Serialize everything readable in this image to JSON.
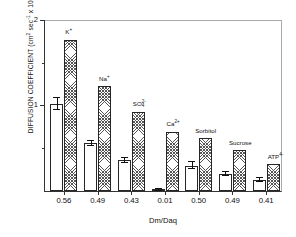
{
  "chart_data": {
    "type": "bar",
    "title": "",
    "xlabel": "Dm/Daq",
    "ylabel": "DIFFUSION COEFFICIENT (cm² sec⁻¹ × 10⁶)",
    "ylabel_parts": {
      "main": "DIFFUSION COEFFICIENT (cm",
      "sup1": "2",
      "mid": " sec",
      "sup2": "-1",
      "tail": " x 10",
      "sup3": "6",
      "close": ")"
    },
    "ylim": [
      0,
      2
    ],
    "y_major_ticks": [
      1,
      2
    ],
    "y_minor_ticks": [
      0.5,
      1.5
    ],
    "y_tick_labels": [
      "1",
      "2"
    ],
    "grid": false,
    "legend": "none",
    "categories": [
      "K+",
      "Na+",
      "SO4 2-",
      "Ca2+",
      "Sorbitol",
      "Sucrose",
      "ATP4-"
    ],
    "category_labels": [
      {
        "text": "K",
        "sup": "+",
        "sub": "",
        "plain": "K⁺"
      },
      {
        "text": "Na",
        "sup": "+",
        "sub": "",
        "plain": "Na⁺"
      },
      {
        "text": "SO",
        "sup": "2-",
        "sub": "4",
        "plain": "SO₄²⁻"
      },
      {
        "text": "Ca",
        "sup": "2+",
        "sub": "",
        "plain": "Ca²⁺"
      },
      {
        "text": "Sorbitol",
        "sup": "",
        "sub": "",
        "plain": "Sorbitol"
      },
      {
        "text": "Sucrose",
        "sup": "",
        "sub": "",
        "plain": "Sucrose"
      },
      {
        "text": "ATP",
        "sup": "4-",
        "sub": "",
        "plain": "ATP⁴⁻"
      }
    ],
    "x_tick_labels": [
      "0.56",
      "0.49",
      "0.43",
      "0.01",
      "0.50",
      "0.49",
      "0.41"
    ],
    "series": [
      {
        "name": "membrane (open)",
        "style": "open",
        "values": [
          1.02,
          0.56,
          0.36,
          0.01,
          0.3,
          0.2,
          0.13
        ],
        "errors": [
          0.07,
          0.03,
          0.03,
          0.01,
          0.04,
          0.02,
          0.02
        ]
      },
      {
        "name": "aqueous (hatched)",
        "style": "hatched",
        "values": [
          1.78,
          1.23,
          0.93,
          0.7,
          0.62,
          0.48,
          0.32
        ],
        "errors": [
          0,
          0,
          0,
          0,
          0,
          0,
          0
        ]
      }
    ],
    "colors": {
      "axis": "#333333",
      "open_fill": "#ffffff",
      "hatch_line": "#555555",
      "text": "#111111"
    }
  }
}
